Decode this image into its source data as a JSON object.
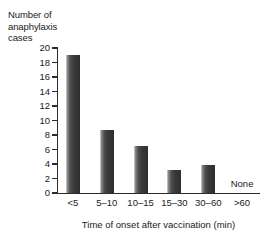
{
  "chart_data": {
    "type": "bar",
    "title": "",
    "categories": [
      "<5",
      "5–10",
      "10–15",
      "15–30",
      "30–60",
      ">60"
    ],
    "values": [
      19,
      8.7,
      6.5,
      3.2,
      3.8,
      0
    ],
    "xlabel": "Time of onset after vaccination (min)",
    "ylabel": "Number of anaphylaxis cases",
    "ylabel_lines": [
      "Number of",
      "anaphylaxis",
      "cases"
    ],
    "ylim": [
      0,
      20
    ],
    "ytick_step": 2,
    "yticks": [
      0,
      2,
      4,
      6,
      8,
      10,
      12,
      14,
      16,
      18,
      20
    ],
    "ytick_labels": [
      "0",
      "2",
      "4",
      "6",
      "8",
      "10",
      "12",
      "14",
      "16",
      "18",
      "20"
    ],
    "grid": false,
    "legend": null,
    "annotations": [
      {
        "text": "None",
        "category": ">60",
        "value": 0
      }
    ],
    "colors": {
      "bar_light": "#d8d8d8",
      "bar_dark": "#2e2e2e",
      "axis": "#2b2b2b",
      "text": "#1a1a1a",
      "background": "#ffffff"
    }
  }
}
